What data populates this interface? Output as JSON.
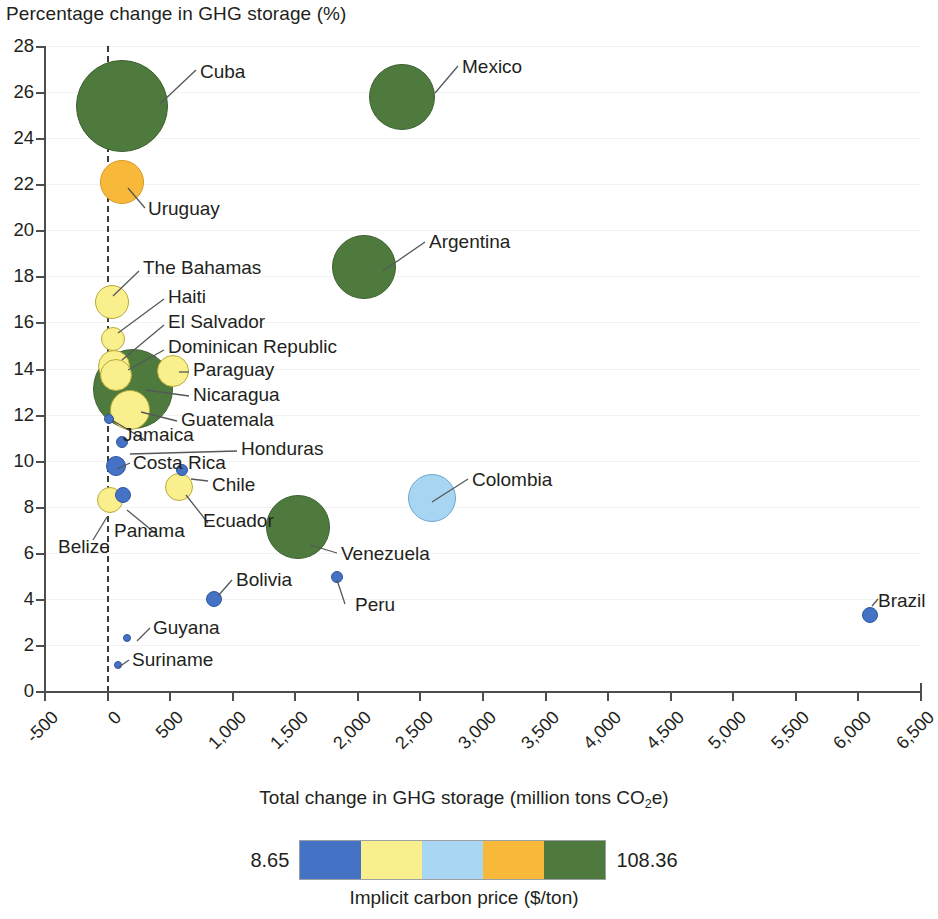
{
  "chart_data": {
    "type": "scatter",
    "title": "",
    "ylabel": "Percentage change in GHG storage (%)",
    "xlabel": "Total change in GHG storage (million tons CO2e)",
    "xlabel_parts": {
      "before": "Total change in GHG storage (million tons CO",
      "sub": "2",
      "after": "e)"
    },
    "xlim": [
      -500,
      6500
    ],
    "ylim": [
      0,
      28
    ],
    "xticks": [
      "-500",
      "0",
      "500",
      "1,000",
      "1,500",
      "2,000",
      "2,500",
      "3,000",
      "3,500",
      "4,000",
      "4,500",
      "5,000",
      "5,500",
      "6,000",
      "6,500"
    ],
    "xtick_values": [
      -500,
      0,
      500,
      1000,
      1500,
      2000,
      2500,
      3000,
      3500,
      4000,
      4500,
      5000,
      5500,
      6000,
      6500
    ],
    "yticks": [
      "0",
      "2",
      "4",
      "6",
      "8",
      "10",
      "12",
      "14",
      "16",
      "18",
      "20",
      "22",
      "24",
      "26",
      "28"
    ],
    "ytick_values": [
      0,
      2,
      4,
      6,
      8,
      10,
      12,
      14,
      16,
      18,
      20,
      22,
      24,
      26,
      28
    ],
    "grid": "horizontal-light",
    "reference_line": {
      "x": 0,
      "style": "dashed"
    },
    "size_encoding": "bubble area ~ magnitude",
    "color_encoding": "Implicit carbon price ($/ton)",
    "points": [
      {
        "name": "Cuba",
        "x": 120,
        "y": 25.4,
        "r": 46,
        "color": "#4e7a3e",
        "label_x": 200,
        "label_y": 62,
        "leader": [
          160,
          104,
          196,
          70
        ]
      },
      {
        "name": "Mexico",
        "x": 2360,
        "y": 25.8,
        "r": 33,
        "color": "#4e7a3e",
        "label_x": 462,
        "label_y": 57,
        "leader": [
          435,
          93,
          458,
          66
        ]
      },
      {
        "name": "Uruguay",
        "x": 120,
        "y": 22.1,
        "r": 22,
        "color": "#f8b83a",
        "label_x": 148,
        "label_y": 199,
        "leader": [
          128,
          188,
          145,
          208
        ]
      },
      {
        "name": "Argentina",
        "x": 2060,
        "y": 18.4,
        "r": 32,
        "color": "#4e7a3e",
        "label_x": 429,
        "label_y": 232,
        "leader": [
          383,
          271,
          425,
          242
        ]
      },
      {
        "name": "The Bahamas",
        "x": 40,
        "y": 16.9,
        "r": 17,
        "color": "#faef8d",
        "label_x": 143,
        "label_y": 258,
        "leader": [
          113,
          296,
          139,
          271
        ]
      },
      {
        "name": "Haiti",
        "x": 50,
        "y": 15.3,
        "r": 12,
        "color": "#faef8d",
        "label_x": 168,
        "label_y": 287,
        "leader": [
          118,
          333,
          164,
          299
        ]
      },
      {
        "name": "El Salvador",
        "x": 60,
        "y": 14.1,
        "r": 16,
        "color": "#faef8d",
        "label_x": 168,
        "label_y": 312,
        "leader": [
          122,
          360,
          164,
          325
        ]
      },
      {
        "name": "Dominican Republic",
        "x": 75,
        "y": 13.7,
        "r": 16,
        "color": "#faef8d",
        "label_x": 168,
        "label_y": 337,
        "leader": [
          128,
          370,
          164,
          350
        ]
      },
      {
        "name": "Paraguay",
        "x": 530,
        "y": 13.9,
        "r": 16,
        "color": "#faef8d",
        "label_x": 193,
        "label_y": 360,
        "leader": [
          179,
          372,
          189,
          372
        ]
      },
      {
        "name": "Nicaragua",
        "x": 210,
        "y": 13.1,
        "r": 40,
        "color": "#4e7a3e",
        "label_x": 193,
        "label_y": 385,
        "leader": [
          146,
          390,
          189,
          396
        ]
      },
      {
        "name": "Guatemala",
        "x": 185,
        "y": 12.2,
        "r": 20,
        "color": "#faef8d",
        "label_x": 181,
        "label_y": 410,
        "leader": [
          141,
          412,
          177,
          421
        ]
      },
      {
        "name": "Jamaica",
        "x": 20,
        "y": 11.8,
        "r": 5,
        "color": "#4472c4",
        "label_x": 123,
        "label_y": 425,
        "leader": [
          112,
          420,
          145,
          440
        ]
      },
      {
        "name": "Honduras",
        "x": 120,
        "y": 10.8,
        "r": 6,
        "color": "#4472c4",
        "label_x": 241,
        "label_y": 439,
        "leader": [
          130,
          454,
          237,
          451
        ]
      },
      {
        "name": "Costa Rica",
        "x": 75,
        "y": 9.75,
        "r": 10,
        "color": "#4472c4",
        "label_x": 133,
        "label_y": 453,
        "leader": [
          117,
          469,
          130,
          463
        ]
      },
      {
        "name": "Chile",
        "x": 600,
        "y": 9.6,
        "r": 6,
        "color": "#4472c4",
        "label_x": 212,
        "label_y": 475,
        "leader": [
          191,
          479,
          208,
          481
        ]
      },
      {
        "name": "Ecuador",
        "x": 580,
        "y": 8.85,
        "r": 14,
        "color": "#faef8d",
        "label_x": 203,
        "label_y": 511,
        "leader": [
          186,
          495,
          208,
          523
        ]
      },
      {
        "name": "Colombia",
        "x": 2600,
        "y": 8.4,
        "r": 24,
        "color": "#a8d5f2",
        "label_x": 472,
        "label_y": 470,
        "leader": [
          432,
          502,
          468,
          479
        ]
      },
      {
        "name": "Panama",
        "x": 130,
        "y": 8.5,
        "r": 8,
        "color": "#4472c4",
        "label_x": 114,
        "label_y": 521,
        "leader": [
          127,
          510,
          155,
          533
        ]
      },
      {
        "name": "Belize",
        "x": 25,
        "y": 8.3,
        "r": 13,
        "color": "#faef8d",
        "label_x": 58,
        "label_y": 537,
        "leader": [
          107,
          517,
          93,
          540
        ]
      },
      {
        "name": "Venezuela",
        "x": 1530,
        "y": 7.1,
        "r": 32,
        "color": "#4e7a3e",
        "label_x": 341,
        "label_y": 544,
        "leader": [
          310,
          545,
          337,
          553
        ]
      },
      {
        "name": "Peru",
        "x": 1840,
        "y": 4.95,
        "r": 6,
        "color": "#4472c4",
        "label_x": 355,
        "label_y": 595,
        "leader": [
          337,
          580,
          345,
          604
        ]
      },
      {
        "name": "Bolivia",
        "x": 860,
        "y": 4.0,
        "r": 8,
        "color": "#4472c4",
        "label_x": 236,
        "label_y": 570,
        "leader": [
          218,
          596,
          232,
          580
        ]
      },
      {
        "name": "Guyana",
        "x": 165,
        "y": 2.3,
        "r": 4,
        "color": "#4472c4",
        "label_x": 153,
        "label_y": 618,
        "leader": [
          137,
          641,
          150,
          628
        ]
      },
      {
        "name": "Suriname",
        "x": 95,
        "y": 1.15,
        "r": 4,
        "color": "#4472c4",
        "label_x": 132,
        "label_y": 650,
        "leader": [
          119,
          667,
          129,
          660
        ]
      },
      {
        "name": "Brazil",
        "x": 6100,
        "y": 3.3,
        "r": 8,
        "color": "#4472c4",
        "label_x": 878,
        "label_y": 591,
        "leader": [
          872,
          606,
          878,
          599
        ]
      }
    ],
    "legend": {
      "min_label": "8.65",
      "max_label": "108.36",
      "caption": "Implicit carbon price ($/ton)",
      "colors": [
        "#4472c4",
        "#faef8d",
        "#a8d5f2",
        "#f8b83a",
        "#4e7a3e"
      ]
    }
  }
}
